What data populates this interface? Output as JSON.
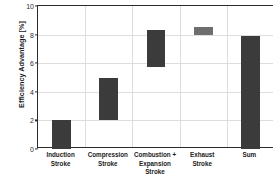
{
  "chart_data": {
    "type": "bar",
    "title": "",
    "subtitle": "",
    "xlabel": "",
    "ylabel": "Efficiency Advantage [%]",
    "ylim": [
      0,
      10
    ],
    "yticks": [
      0,
      2,
      4,
      6,
      8,
      10
    ],
    "ytick_labels": [
      "0",
      "2",
      "4",
      "6",
      "8",
      "10"
    ],
    "grid": true,
    "legend": "none",
    "categories": [
      "Induction\nStroke",
      "Compression\nStroke",
      "Combustion +\nExpansion Stroke",
      "Exhaust\nStroke",
      "Sum"
    ],
    "category_labels": [
      "Induction Stroke",
      "Compression Stroke",
      "Combustion + Expansion Stroke",
      "Exhaust Stroke",
      "Sum"
    ],
    "waterfall": true,
    "bars": [
      {
        "label": "Induction Stroke",
        "base": 0.0,
        "top": 2.05,
        "value": 2.05,
        "color": "#3b3b3b"
      },
      {
        "label": "Compression Stroke",
        "base": 2.05,
        "top": 5.0,
        "value": 2.95,
        "color": "#3b3b3b"
      },
      {
        "label": "Combustion + Expansion Stroke",
        "base": 5.7,
        "top": 8.35,
        "value": 2.65,
        "color": "#3b3b3b"
      },
      {
        "label": "Exhaust Stroke",
        "base": 8.0,
        "top": 8.55,
        "value": 0.55,
        "color": "#6e6e6e"
      },
      {
        "label": "Sum",
        "base": 0.0,
        "top": 7.9,
        "value": 7.9,
        "color": "#3b3b3b"
      }
    ],
    "colors": {
      "bar_dark": "#3b3b3b",
      "bar_light": "#6e6e6e",
      "axis": "#2b2b2b",
      "grid": "#dddddd",
      "background": "#ffffff"
    }
  }
}
